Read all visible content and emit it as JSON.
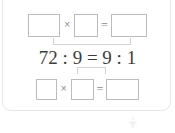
{
  "card": {
    "label": "math-exercise-card"
  },
  "exercise": {
    "top_row": {
      "box1_value": "",
      "multiply_symbol": "×",
      "box2_value": "",
      "equals_symbol": "=",
      "box3_value": ""
    },
    "middle_equation": {
      "text": "72 : 9 = 9 : 1",
      "left_antecedent": "72",
      "ratio_symbol": ":",
      "left_consequent": "9",
      "equals_symbol": "=",
      "right_antecedent": "9",
      "right_consequent": "1"
    },
    "bottom_row": {
      "box1_value": "",
      "multiply_symbol": "×",
      "box2_value": "",
      "equals_symbol": "=",
      "box3_value": ""
    },
    "connectors": {
      "top_bracket": "bracket-linking-top-boxes-to-equation",
      "bottom_bracket": "bracket-linking-equation-to-bottom-boxes"
    }
  },
  "watermark": {
    "mark": "⸎"
  },
  "colors": {
    "page_background": "#ffffff",
    "card_border": "#e6e6e6",
    "input_box_border": "#bcbcbc",
    "equation_text": "#3d3d3d",
    "operator_text": "#8b8b8b",
    "bracket_line": "#d2d2d2"
  }
}
